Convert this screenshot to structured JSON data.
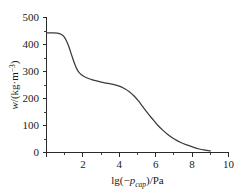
{
  "chart_data": {
    "type": "line",
    "title": "",
    "subtitle": "",
    "xlabel": "lg(−p_cap)/Pa",
    "xlabel_parts": {
      "prefix": "lg(−",
      "symbol": "p",
      "subscript": "cap",
      "suffix": ")/Pa"
    },
    "ylabel": "w/(kg·m⁻³)",
    "ylabel_parts": {
      "symbol": "w",
      "mid": "/(kg·m",
      "superscript": "−3",
      "suffix": ")"
    },
    "xlim": [
      0,
      10
    ],
    "ylim": [
      0,
      500
    ],
    "xticks": [
      0,
      2,
      4,
      6,
      8,
      10
    ],
    "xtick_labels": [
      "",
      "2",
      "4",
      "6",
      "8",
      "10"
    ],
    "xminor_ticks": [
      1,
      3,
      5,
      7,
      9
    ],
    "yticks": [
      0,
      100,
      200,
      300,
      400,
      500
    ],
    "ytick_labels": [
      "0",
      "100",
      "200",
      "300",
      "400",
      "500"
    ],
    "yminor_ticks": [
      50,
      150,
      250,
      350,
      450
    ],
    "grid": false,
    "legend": false,
    "legend_position": "none",
    "series": [
      {
        "name": "water retention curve",
        "color": "#3a3a3a",
        "x": [
          0.0,
          0.3,
          0.6,
          0.8,
          0.95,
          1.1,
          1.25,
          1.4,
          1.55,
          1.7,
          1.85,
          2.0,
          2.2,
          2.45,
          2.7,
          3.0,
          3.3,
          3.6,
          3.9,
          4.1,
          4.3,
          4.55,
          4.8,
          5.05,
          5.3,
          5.55,
          5.8,
          6.1,
          6.4,
          6.7,
          7.0,
          7.35,
          7.7,
          8.05,
          8.4,
          8.7,
          9.0
        ],
        "y": [
          443,
          443,
          442,
          438,
          430,
          413,
          388,
          357,
          328,
          305,
          292,
          284,
          277,
          271,
          266,
          261,
          257,
          253,
          248,
          243,
          236,
          225,
          210,
          191,
          169,
          147,
          126,
          102,
          82,
          65,
          51,
          38,
          28,
          20,
          13,
          9,
          6
        ]
      }
    ],
    "annotations": []
  },
  "figure": {
    "background_color": "#ffffff",
    "axis_color": "#2b2b2b",
    "curve_color": "#3a3a3a"
  }
}
